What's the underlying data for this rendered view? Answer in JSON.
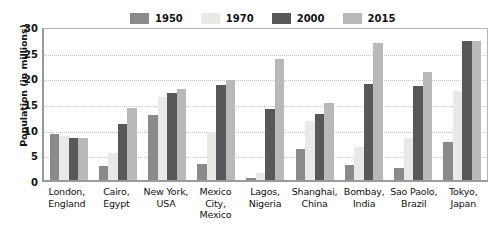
{
  "chart_data": {
    "type": "bar",
    "title": "",
    "xlabel": "",
    "ylabel": "Population (in millions)",
    "ylim": [
      0,
      30
    ],
    "yticks": [
      0,
      5,
      10,
      15,
      20,
      25,
      30
    ],
    "grid": true,
    "legend_position": "top-center",
    "categories": [
      "London, England",
      "Cairo, Egypt",
      "New York, USA",
      "Mexico City, Mexico",
      "Lagos, Nigeria",
      "Shanghai, China",
      "Bombay, India",
      "Sao Paolo, Brazil",
      "Tokyo, Japan"
    ],
    "category_lines": [
      [
        "London,",
        "England"
      ],
      [
        "Cairo,",
        "Egypt"
      ],
      [
        "New York,",
        "USA"
      ],
      [
        "Mexico",
        "City,",
        "Mexico"
      ],
      [
        "Lagos,",
        "Nigeria"
      ],
      [
        "Shanghai,",
        "China"
      ],
      [
        "Bombay,",
        "India"
      ],
      [
        "Sao Paolo,",
        "Brazil"
      ],
      [
        "Tokyo,",
        "Japan"
      ]
    ],
    "series": [
      {
        "name": "1950",
        "color": "#8a8a8a",
        "values": [
          9.0,
          2.8,
          12.6,
          3.1,
          0.3,
          6.0,
          2.9,
          2.4,
          7.5
        ]
      },
      {
        "name": "1970",
        "color": "#e9e9e6",
        "values": [
          8.6,
          5.3,
          16.2,
          9.4,
          1.4,
          11.4,
          6.4,
          8.1,
          17.3
        ]
      },
      {
        "name": "2000",
        "color": "#58585a",
        "values": [
          8.2,
          10.9,
          17.0,
          18.6,
          13.9,
          12.9,
          18.8,
          18.3,
          27.1
        ]
      },
      {
        "name": "2015",
        "color": "#b9b9b7",
        "values": [
          8.1,
          14.1,
          17.8,
          19.5,
          23.6,
          15.1,
          26.7,
          21.0,
          27.0
        ]
      }
    ]
  }
}
